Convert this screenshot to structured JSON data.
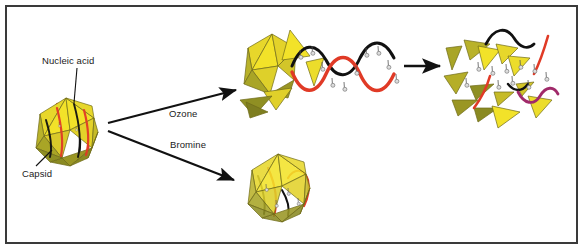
{
  "figure": {
    "border_color": "#3a3a3a",
    "background": "#ffffff"
  },
  "labels": {
    "nucleic_acid": "Nucleic acid",
    "capsid": "Capsid",
    "ozone": "Ozone",
    "bromine": "Bromine"
  },
  "colors": {
    "capsid_bright": "#f2e229",
    "capsid_mid": "#e3d22a",
    "capsid_olive": "#a9a526",
    "capsid_dark_olive": "#8a8a22",
    "capsid_edge": "#6f6a18",
    "strand_red": "#e03a26",
    "strand_black": "#111111",
    "strand_magenta": "#a02a6a",
    "marker_gray": "#d8d8d8",
    "marker_stroke": "#555555",
    "arrow": "#111111",
    "leader": "#111111",
    "text": "#1a1a1a"
  },
  "stages": [
    {
      "id": "intact-virus",
      "name": "Intact virus particle",
      "description": "Icosahedral capsid enclosing nucleic acid",
      "capsid_state": "intact",
      "nucleic_acid_state": "intact"
    },
    {
      "id": "ozone-product",
      "name": "Ozone-treated virus",
      "description": "Capsid disassembled, nucleic acid released and oxidised",
      "capsid_state": "partially disassembled",
      "nucleic_acid_state": "released helix with oxidation adducts"
    },
    {
      "id": "ozone-fragments",
      "name": "Fully degraded virus",
      "description": "Capsid fragmented into loose subunits, nucleic acid cleaved",
      "capsid_state": "fragmented",
      "nucleic_acid_state": "cleaved into segments"
    },
    {
      "id": "bromine-product",
      "name": "Bromine-treated virus",
      "description": "Capsid intact, internal nucleic acid chemically modified",
      "capsid_state": "intact",
      "nucleic_acid_state": "modified in place"
    }
  ],
  "arrows": [
    {
      "id": "arrow-ozone",
      "label": "Ozone",
      "from": "intact-virus",
      "to": "ozone-product"
    },
    {
      "id": "arrow-bromine",
      "label": "Bromine",
      "from": "intact-virus",
      "to": "bromine-product"
    },
    {
      "id": "arrow-degradation",
      "label": "",
      "from": "ozone-product",
      "to": "ozone-fragments"
    }
  ],
  "leader_lines": [
    {
      "id": "leader-nucleic-acid",
      "label": "Nucleic acid",
      "points_to": "nucleic acid strand inside intact capsid"
    },
    {
      "id": "leader-capsid",
      "label": "Capsid",
      "points_to": "outer protein shell of intact capsid"
    }
  ]
}
